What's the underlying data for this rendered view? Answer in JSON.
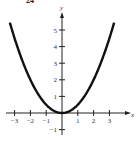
{
  "figure_label": "24",
  "chart_data": {
    "type": "line",
    "title": "",
    "function": "y = x^2 / 2",
    "xlabel": "x",
    "ylabel": "y",
    "xlim": [
      -3.3,
      3.5
    ],
    "ylim": [
      -1.3,
      6
    ],
    "x_ticks": [
      -3,
      -2,
      -1,
      1,
      2,
      3
    ],
    "y_ticks": [
      -1,
      1,
      2,
      3,
      4,
      5
    ],
    "x_tick_labels": [
      "−3",
      "−2",
      "−1",
      "1",
      "2",
      "3"
    ],
    "y_tick_labels": [
      "−1",
      "1",
      "2",
      "3",
      "4",
      "5"
    ],
    "series": [
      {
        "name": "y = x^2/2",
        "x": [
          -3.3,
          -3,
          -2.5,
          -2,
          -1.5,
          -1,
          -0.5,
          0,
          0.5,
          1,
          1.5,
          2,
          2.5,
          3,
          3.3
        ],
        "y": [
          5.45,
          4.5,
          3.125,
          2,
          1.125,
          0.5,
          0.125,
          0,
          0.125,
          0.5,
          1.125,
          2,
          3.125,
          4.5,
          5.45
        ]
      }
    ],
    "grid": false,
    "legend": "none",
    "line_color": "#111111"
  }
}
